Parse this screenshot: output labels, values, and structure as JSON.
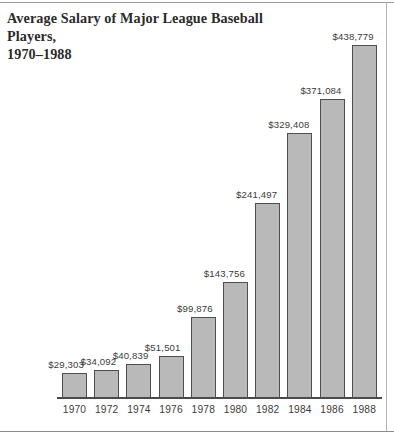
{
  "figure": {
    "title_line1": "Average Salary of Major League Baseball Players,",
    "title_line2": "1970–1988",
    "title_full": "Average Salary of Major League Baseball Players,\n1970–1988"
  },
  "colors": {
    "bar_fill": "#b9b9b9",
    "bar_outline": "#4f4f4f",
    "axis": "#4a4a4a",
    "text": "#3b3b3b",
    "title_text": "#2b2b2b",
    "frame_rule": "#8c8c8c",
    "background": "#ffffff"
  },
  "chart_data": {
    "type": "bar",
    "title": "Average Salary of Major League Baseball Players, 1970–1988",
    "xlabel": "",
    "ylabel": "",
    "grid": false,
    "legend": false,
    "orientation": "vertical",
    "ylim": [
      0,
      438779
    ],
    "categories": [
      "1970",
      "1972",
      "1974",
      "1976",
      "1978",
      "1980",
      "1982",
      "1984",
      "1986",
      "1988"
    ],
    "values": [
      29303,
      34092,
      40839,
      51501,
      99876,
      143756,
      241497,
      329408,
      371084,
      438779
    ],
    "value_labels": [
      "$29,303",
      "$34,092",
      "$40,839",
      "$51,501",
      "$99,876",
      "$143,756",
      "$241,497",
      "$329,408",
      "$371,084",
      "$438,779"
    ],
    "tick_labels": [
      "1970",
      "1972",
      "1974",
      "1976",
      "1978",
      "1980",
      "1982",
      "1984",
      "1986",
      "1988"
    ],
    "label_position": "above-left-of-bar",
    "units": "US dollars"
  }
}
